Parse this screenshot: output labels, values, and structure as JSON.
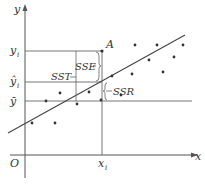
{
  "diagram": {
    "axes": {
      "x_label": "x",
      "y_label": "y",
      "origin_label": "O"
    },
    "y_ticks": {
      "y_i": "y",
      "y_i_sub": "i",
      "y_hat_i": "ŷ",
      "y_hat_i_sub": "i",
      "y_bar": "ȳ"
    },
    "x_ticks": {
      "x_i": "x",
      "x_i_sub": "i"
    },
    "point_label": "A",
    "brackets": {
      "sst": "SST",
      "sse": "SSE",
      "ssr": "SSR"
    },
    "colors": {
      "line": "#555555",
      "point": "#333333",
      "text": "#333333"
    }
  }
}
